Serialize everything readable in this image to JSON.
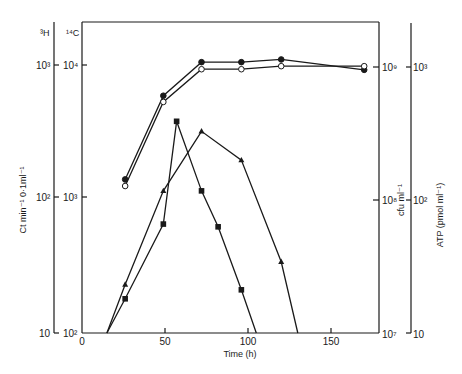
{
  "chart_data": {
    "type": "line",
    "title": "",
    "xlabel": "Time (h)",
    "xlim": [
      0,
      175
    ],
    "x_ticks": [
      "0",
      "50",
      "100",
      "150"
    ],
    "y_axes": [
      {
        "name": "3H",
        "label": "Ct min-1 0.1ml-1",
        "position": "left-outer",
        "scale": "log",
        "ticks": [
          "10",
          "10²",
          "10³"
        ],
        "range": [
          10,
          1000
        ]
      },
      {
        "name": "14C",
        "label": "Ct min-1 0.1ml-1",
        "position": "left-inner",
        "scale": "log",
        "ticks": [
          "10²",
          "10³",
          "10⁴"
        ],
        "range": [
          100,
          10000
        ]
      },
      {
        "name": "cfu",
        "label": "cfu ml-1",
        "position": "right-inner",
        "scale": "log",
        "ticks": [
          "10⁷",
          "10⁸",
          "10⁹"
        ],
        "range": [
          10000000,
          1000000000
        ]
      },
      {
        "name": "ATP",
        "label": "ATP (pmol ml-1)",
        "position": "right-outer",
        "scale": "log",
        "ticks": [
          "10",
          "10²",
          "10³"
        ],
        "range": [
          10,
          1000
        ]
      }
    ],
    "series": [
      {
        "name": "filled-circle",
        "marker": "filled-circle",
        "x": [
          26,
          49,
          72,
          96,
          120,
          170
        ],
        "y_14C_scale": [
          1400,
          5900,
          10500,
          10500,
          11000,
          9200
        ]
      },
      {
        "name": "open-circle",
        "marker": "open-circle",
        "x": [
          26,
          49,
          72,
          96,
          120,
          170
        ],
        "y_14C_scale": [
          1250,
          5300,
          9300,
          9300,
          9800,
          9800
        ]
      },
      {
        "name": "filled-triangle",
        "marker": "filled-triangle",
        "x": [
          15,
          26,
          49,
          72,
          96,
          120,
          130
        ],
        "y_14C_scale": [
          100,
          230,
          1150,
          3200,
          1950,
          340,
          100
        ]
      },
      {
        "name": "filled-square",
        "marker": "filled-square",
        "x": [
          15,
          26,
          49,
          57,
          72,
          82,
          96,
          105
        ],
        "y_14C_scale": [
          100,
          180,
          650,
          3800,
          1150,
          620,
          210,
          100
        ]
      }
    ],
    "grid": false,
    "legend": null
  },
  "labels": {
    "left_outer_header": "3H",
    "left_inner_header": "14C",
    "left_axis_title": "Ct min⁻¹ 0·1ml⁻¹",
    "right_inner_title": "cfu ml⁻¹",
    "right_outer_title": "ATP (pmol ml⁻¹)",
    "x_axis_title": "Time (h)"
  }
}
